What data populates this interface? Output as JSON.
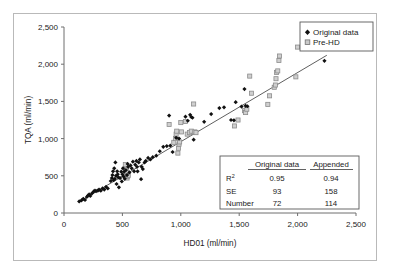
{
  "chart_data": {
    "type": "scatter",
    "title": "",
    "xlabel": "HD01 (ml/min)",
    "ylabel": "TQA (ml/min)",
    "xlim": [
      0,
      2500
    ],
    "ylim": [
      0,
      2500
    ],
    "xticks": [
      0,
      500,
      1000,
      1500,
      2000,
      2500
    ],
    "yticks": [
      0,
      500,
      1000,
      1500,
      2000,
      2500
    ],
    "xtick_labels": [
      "0",
      "500",
      "1,000",
      "1,500",
      "2,000",
      "2,500"
    ],
    "ytick_labels": [
      "0",
      "500",
      "1,000",
      "1,500",
      "2,000",
      "2,500"
    ],
    "grid": false,
    "legend_position": "top-right",
    "trendline": {
      "name": "regression-line",
      "x": [
        130,
        2250
      ],
      "y": [
        150,
        2120
      ],
      "color": "#4d4d4d"
    },
    "series": [
      {
        "name": "Original data",
        "marker": "filled-diamond",
        "color": "#111111",
        "points": [
          [
            130,
            155
          ],
          [
            150,
            170
          ],
          [
            165,
            190
          ],
          [
            180,
            175
          ],
          [
            195,
            215
          ],
          [
            205,
            235
          ],
          [
            215,
            250
          ],
          [
            225,
            230
          ],
          [
            240,
            265
          ],
          [
            255,
            290
          ],
          [
            265,
            300
          ],
          [
            275,
            295
          ],
          [
            290,
            300
          ],
          [
            300,
            315
          ],
          [
            315,
            300
          ],
          [
            330,
            330
          ],
          [
            345,
            315
          ],
          [
            360,
            350
          ],
          [
            375,
            330
          ],
          [
            400,
            430
          ],
          [
            410,
            470
          ],
          [
            415,
            510
          ],
          [
            420,
            560
          ],
          [
            425,
            440
          ],
          [
            430,
            600
          ],
          [
            435,
            460
          ],
          [
            440,
            680
          ],
          [
            445,
            500
          ],
          [
            450,
            390
          ],
          [
            455,
            560
          ],
          [
            460,
            520
          ],
          [
            465,
            480
          ],
          [
            470,
            345
          ],
          [
            480,
            470
          ],
          [
            490,
            555
          ],
          [
            495,
            425
          ],
          [
            500,
            520
          ],
          [
            505,
            600
          ],
          [
            510,
            490
          ],
          [
            515,
            555
          ],
          [
            520,
            460
          ],
          [
            530,
            575
          ],
          [
            540,
            510
          ],
          [
            545,
            660
          ],
          [
            550,
            620
          ],
          [
            560,
            545
          ],
          [
            570,
            640
          ],
          [
            580,
            600
          ],
          [
            590,
            690
          ],
          [
            600,
            560
          ],
          [
            610,
            650
          ],
          [
            620,
            700
          ],
          [
            625,
            620
          ],
          [
            630,
            560
          ],
          [
            640,
            680
          ],
          [
            650,
            720
          ],
          [
            660,
            455
          ],
          [
            665,
            620
          ],
          [
            675,
            590
          ],
          [
            690,
            680
          ],
          [
            700,
            700
          ],
          [
            720,
            740
          ],
          [
            740,
            720
          ],
          [
            760,
            750
          ],
          [
            790,
            770
          ],
          [
            820,
            830
          ],
          [
            850,
            890
          ],
          [
            880,
            900
          ],
          [
            900,
            1310
          ],
          [
            910,
            905
          ],
          [
            930,
            820
          ],
          [
            960,
            1010
          ],
          [
            985,
            1000
          ],
          [
            1040,
            1295
          ],
          [
            1060,
            1240
          ],
          [
            1080,
            1320
          ],
          [
            1090,
            1290
          ],
          [
            1100,
            1280
          ],
          [
            1110,
            985
          ],
          [
            1200,
            1225
          ],
          [
            1260,
            1330
          ],
          [
            1330,
            1410
          ],
          [
            1370,
            1420
          ],
          [
            1430,
            1250
          ],
          [
            1455,
            1245
          ],
          [
            1470,
            1490
          ],
          [
            1520,
            1430
          ],
          [
            1545,
            1665
          ],
          [
            1555,
            1440
          ],
          [
            1570,
            1435
          ],
          [
            2230,
            2045
          ]
        ]
      },
      {
        "name": "Pre-HD",
        "marker": "open-square",
        "color": "#8c8c8c",
        "points": [
          [
            525,
            650
          ],
          [
            530,
            585
          ],
          [
            535,
            560
          ],
          [
            540,
            470
          ],
          [
            545,
            490
          ],
          [
            550,
            505
          ],
          [
            900,
            1190
          ],
          [
            940,
            950
          ],
          [
            955,
            1000
          ],
          [
            960,
            1060
          ],
          [
            965,
            1100
          ],
          [
            975,
            805
          ],
          [
            980,
            870
          ],
          [
            985,
            925
          ],
          [
            990,
            955
          ],
          [
            1000,
            1215
          ],
          [
            1005,
            1090
          ],
          [
            1040,
            1230
          ],
          [
            1055,
            1060
          ],
          [
            1075,
            1080
          ],
          [
            1090,
            1100
          ],
          [
            1110,
            1465
          ],
          [
            1120,
            1090
          ],
          [
            1130,
            1080
          ],
          [
            1460,
            1170
          ],
          [
            1490,
            1250
          ],
          [
            1545,
            1375
          ],
          [
            1555,
            1350
          ],
          [
            1565,
            1395
          ],
          [
            1590,
            1840
          ],
          [
            1605,
            1610
          ],
          [
            1745,
            1460
          ],
          [
            1760,
            1575
          ],
          [
            1800,
            1690
          ],
          [
            1810,
            1720
          ],
          [
            1815,
            1805
          ],
          [
            1820,
            1890
          ],
          [
            1830,
            1910
          ],
          [
            1840,
            2050
          ],
          [
            1845,
            2110
          ],
          [
            1985,
            1830
          ],
          [
            2000,
            2230
          ]
        ]
      }
    ],
    "stats_table": {
      "columns": [
        "",
        "Original data",
        "Appended"
      ],
      "rows": [
        {
          "label": "R",
          "sup": "2",
          "original": "0.95",
          "appended": "0.94"
        },
        {
          "label": "SE",
          "sup": "",
          "original": "93",
          "appended": "158"
        },
        {
          "label": "Number",
          "sup": "",
          "original": "72",
          "appended": "114"
        }
      ]
    }
  },
  "legend": {
    "entries": [
      {
        "label": "Original data",
        "marker": "filled-diamond"
      },
      {
        "label": "Pre-HD",
        "marker": "open-square"
      }
    ]
  }
}
